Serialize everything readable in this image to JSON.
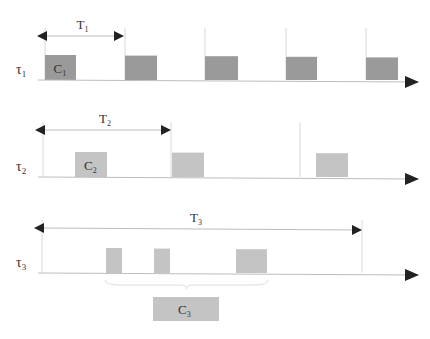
{
  "colors": {
    "task1_box": "#9a9a9a",
    "task2_box": "#c4c4c4",
    "task3_box": "#c4c4c4",
    "axis": "#bdbdbd",
    "arrow_head": "#222222",
    "text": "#333333"
  },
  "tasks": [
    {
      "name": "τ",
      "index": "1",
      "period_label": "T",
      "period_index": "1",
      "exec_label": "C",
      "exec_index": "1",
      "axis_y": 80,
      "period_arrow": {
        "x1": 45,
        "x2": 124,
        "y": 36
      },
      "ticks": [
        45,
        125,
        205,
        286,
        366
      ],
      "boxes": [
        {
          "x": 45,
          "w": 31,
          "label": true
        },
        {
          "x": 125,
          "w": 32
        },
        {
          "x": 205,
          "w": 33
        },
        {
          "x": 286,
          "w": 31
        },
        {
          "x": 366,
          "w": 32
        }
      ],
      "box_top": 55
    },
    {
      "name": "τ",
      "index": "2",
      "period_label": "T",
      "period_index": "2",
      "exec_label": "C",
      "exec_index": "2",
      "axis_y": 177,
      "period_arrow": {
        "x1": 43,
        "x2": 171,
        "y": 130
      },
      "ticks": [
        43,
        171,
        300
      ],
      "boxes": [
        {
          "x": 75,
          "w": 32,
          "label": true
        },
        {
          "x": 172,
          "w": 32
        },
        {
          "x": 316,
          "w": 32
        }
      ],
      "box_top": 152
    },
    {
      "name": "τ",
      "index": "3",
      "period_label": "T",
      "period_index": "3",
      "exec_label": "C",
      "exec_index": "3",
      "axis_y": 273,
      "period_arrow": {
        "x1": 42,
        "x2": 362,
        "y": 228
      },
      "ticks": [
        42,
        362
      ],
      "boxes": [
        {
          "x": 106,
          "w": 16
        },
        {
          "x": 154,
          "w": 16
        },
        {
          "x": 236,
          "w": 31
        }
      ],
      "box_top": 248,
      "total_box": {
        "x": 153,
        "y": 297,
        "w": 66,
        "h": 24
      },
      "brace": {
        "x1": 105,
        "x2": 268,
        "y": 280
      }
    }
  ]
}
